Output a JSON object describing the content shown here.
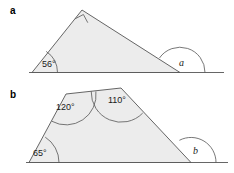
{
  "figure": {
    "title": "",
    "parts": [
      {
        "key": "a",
        "label": "a",
        "shape": "right-triangle",
        "angles": [
          {
            "name": "base-left-angle",
            "value": "56°",
            "known": true
          },
          {
            "name": "apex-right-angle",
            "value": "",
            "known": true,
            "marker": "right-angle-square"
          },
          {
            "name": "exterior-angle",
            "value": "a",
            "known": false
          }
        ]
      },
      {
        "key": "b",
        "label": "b",
        "shape": "quadrilateral-trapezium",
        "angles": [
          {
            "name": "top-left-angle",
            "value": "120°",
            "known": true
          },
          {
            "name": "top-right-angle",
            "value": "110°",
            "known": true
          },
          {
            "name": "bottom-left-angle",
            "value": "65°",
            "known": true
          },
          {
            "name": "exterior-angle",
            "value": "b",
            "known": false
          }
        ]
      }
    ],
    "colors": {
      "shape_fill": "#ececec",
      "stroke": "#555555",
      "text": "#1a1a1a",
      "background": "#ffffff"
    }
  }
}
